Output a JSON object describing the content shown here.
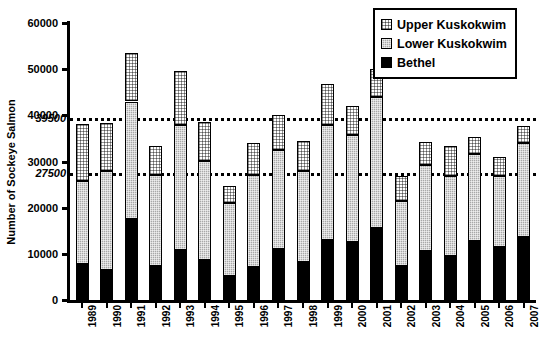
{
  "chart_data": {
    "type": "bar",
    "subtype": "stacked-column",
    "title": "",
    "xlabel": "",
    "ylabel": "Number of Sockeye Salmon",
    "ylim": [
      0,
      60000
    ],
    "ytick_labels": [
      "0",
      "10000",
      "20000",
      "30000",
      "40000",
      "50000",
      "60000"
    ],
    "ytick_values": [
      0,
      10000,
      20000,
      30000,
      40000,
      50000,
      60000
    ],
    "minor_tick_labels": [
      "27500",
      "39500"
    ],
    "minor_tick_values": [
      27500,
      39500
    ],
    "grid": false,
    "legend_position": "top-right",
    "reference_lines": [
      {
        "value": 39500,
        "label": "39500",
        "style": "dotted"
      },
      {
        "value": 27500,
        "label": "27500",
        "style": "dotted"
      }
    ],
    "categories": [
      "1989",
      "1990",
      "1991",
      "1992",
      "1993",
      "1994",
      "1995",
      "1996",
      "1997",
      "1998",
      "1999",
      "2000",
      "2001",
      "2002",
      "2003",
      "2004",
      "2005",
      "2006",
      "2007"
    ],
    "series": [
      {
        "name": "Bethel",
        "values": [
          7800,
          6600,
          17600,
          7300,
          10800,
          8700,
          5200,
          7100,
          11100,
          8300,
          12900,
          12600,
          15500,
          7300,
          10700,
          9600,
          12800,
          11500,
          13700
        ]
      },
      {
        "name": "Lower Kuskokwim",
        "values": [
          18000,
          21300,
          25400,
          19700,
          27100,
          21400,
          15900,
          20000,
          21400,
          19700,
          25100,
          23200,
          28400,
          14200,
          18600,
          17200,
          18900,
          15400,
          20300
        ]
      },
      {
        "name": "Upper Kuskokwim",
        "values": [
          12300,
          10500,
          10500,
          6300,
          11800,
          8400,
          3500,
          7000,
          7500,
          6400,
          8700,
          6300,
          6200,
          5300,
          5000,
          6500,
          3600,
          4100,
          3800
        ]
      }
    ],
    "totals": [
      38100,
      38400,
      53500,
      33300,
      49700,
      38500,
      24600,
      34100,
      40000,
      34400,
      46700,
      42100,
      50100,
      26800,
      34300,
      33300,
      35300,
      31000,
      37800
    ]
  },
  "legend": {
    "items": [
      {
        "label": "Upper Kuskokwim",
        "swatch": "upper"
      },
      {
        "label": "Lower Kuskokwim",
        "swatch": "lower"
      },
      {
        "label": "Bethel",
        "swatch": "bethel"
      }
    ]
  }
}
